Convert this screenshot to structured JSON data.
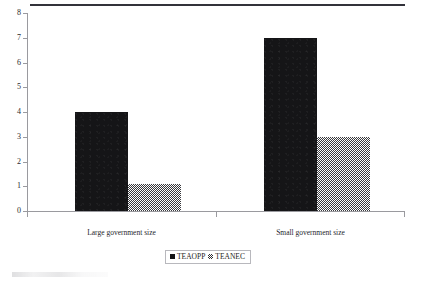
{
  "figure": {
    "top_rule": true,
    "background_color": "#ffffff"
  },
  "legend": {
    "position": "bottom-center",
    "entries": [
      {
        "label": "TEAOPP",
        "swatch": "solid-black-square-icon",
        "color": "#141416"
      },
      {
        "label": "TEANEC",
        "swatch": "checkered-square-icon",
        "color": "#2f2f33"
      }
    ]
  },
  "axes": {
    "y_ticks": [
      "8",
      "7",
      "6",
      "5",
      "4",
      "3",
      "2",
      "1",
      "0"
    ],
    "x_categories": [
      "Large government size",
      "Small government size"
    ]
  },
  "chart_data": {
    "type": "bar",
    "title": "",
    "subtitle": "",
    "xlabel": "",
    "ylabel": "",
    "categories": [
      "Large government size",
      "Small government size"
    ],
    "series": [
      {
        "name": "TEAOPP",
        "values": [
          4,
          7
        ],
        "fill": "solid",
        "color": "#141416"
      },
      {
        "name": "TEANEC",
        "values": [
          1.1,
          3
        ],
        "fill": "checkerboard",
        "color": "#2f2f33"
      }
    ],
    "ylim": [
      0,
      8
    ],
    "ytick_values": [
      0,
      1,
      2,
      3,
      4,
      5,
      6,
      7,
      8
    ],
    "grid": false,
    "legend_position": "bottom-center",
    "annotations": []
  }
}
